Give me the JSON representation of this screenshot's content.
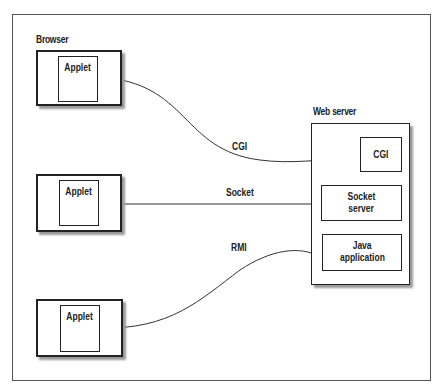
{
  "diagram": {
    "browser_label": "Browser",
    "applets": [
      {
        "label": "Applet"
      },
      {
        "label": "Applet"
      },
      {
        "label": "Applet"
      }
    ],
    "web_server": {
      "label": "Web server",
      "components": [
        {
          "label": "CGI"
        },
        {
          "label": "Socket\nserver",
          "line1": "Socket",
          "line2": "server"
        },
        {
          "label": "Java\napplication",
          "line1": "Java",
          "line2": "application"
        }
      ]
    },
    "connections": [
      {
        "label": "CGI",
        "from": "applet-1",
        "to": "cgi"
      },
      {
        "label": "Socket",
        "from": "applet-2",
        "to": "socket-server"
      },
      {
        "label": "RMI",
        "from": "applet-3",
        "to": "java-application"
      }
    ]
  }
}
